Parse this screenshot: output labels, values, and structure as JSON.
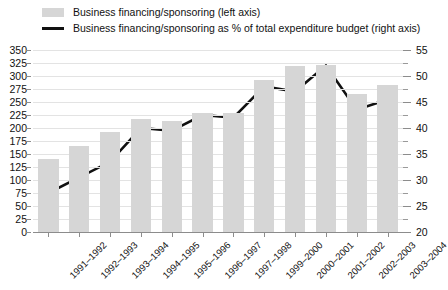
{
  "legend": {
    "bar_label": "Business financing/sponsoring (left axis)",
    "line_label": "Business financing/sponsoring as % of total expenditure budget (right axis)",
    "bar_color": "#d6d6d6",
    "line_color": "#111111"
  },
  "chart_data": {
    "type": "bar",
    "title": "",
    "subtitle": "",
    "xlabel": "",
    "ylabel": "",
    "grid": true,
    "legend_position": "top",
    "categories": [
      "1991–1992",
      "1992–1993",
      "1993–1994",
      "1994–1995",
      "1995–1996",
      "1996–1997",
      "1997–1998",
      "1999–2000",
      "2000–2001",
      "2001–2002",
      "2002–2003",
      "2003–2004"
    ],
    "series": [
      {
        "name": "Business financing/sponsoring (left axis)",
        "type": "bar",
        "axis": "left",
        "color": "#d6d6d6",
        "values": [
          140,
          165,
          192,
          217,
          213,
          228,
          228,
          293,
          320,
          322,
          265,
          283
        ]
      },
      {
        "name": "Business financing/sponsoring as % of total expenditure budget (right axis)",
        "type": "line",
        "axis": "right",
        "color": "#111111",
        "values": [
          27.5,
          30.5,
          33.5,
          40.0,
          39.5,
          42.5,
          42.0,
          48.0,
          47.0,
          52.0,
          43.5,
          45.5
        ]
      }
    ],
    "left_axis": {
      "min": 0,
      "max": 350,
      "step": 25,
      "ticks": [
        0,
        25,
        50,
        75,
        100,
        125,
        150,
        175,
        200,
        225,
        250,
        275,
        300,
        325,
        350
      ]
    },
    "right_axis": {
      "min": 20,
      "max": 55,
      "step": 5,
      "minor_step": 2.5,
      "ticks": [
        20,
        25,
        30,
        35,
        40,
        45,
        50,
        55
      ]
    }
  }
}
